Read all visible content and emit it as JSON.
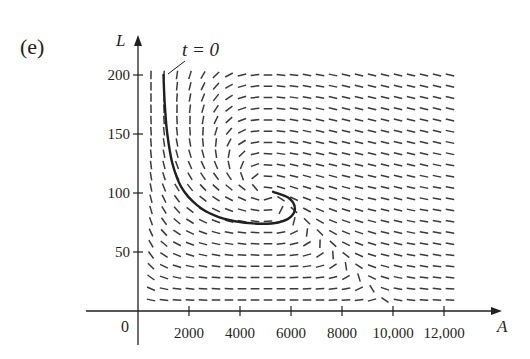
{
  "figure": {
    "panel_label": "(e)",
    "annotation": "t = 0"
  },
  "chart_data": {
    "type": "direction_field",
    "title": "",
    "panel": "(e)",
    "xlabel": "A",
    "ylabel": "L",
    "xlim": [
      0,
      12000
    ],
    "ylim": [
      0,
      200
    ],
    "x_ticks": [
      2000,
      4000,
      6000,
      8000,
      10000,
      12000
    ],
    "x_tick_labels": [
      "2000",
      "4000",
      "6000",
      "8000",
      "10,000",
      "12,000"
    ],
    "y_ticks": [
      50,
      100,
      150,
      200
    ],
    "y_tick_labels": [
      "50",
      "100",
      "150",
      "200"
    ],
    "origin_label": "0",
    "grid": false,
    "field_model": {
      "dA_dt": "2A(1 - A/10000) - 0.01AL",
      "dL_dt": "-0.5L + 0.0001AL",
      "columns": 24,
      "rows": 21
    },
    "trajectory": {
      "label": "t = 0",
      "points": [
        [
          1000,
          200
        ],
        [
          1050,
          175
        ],
        [
          1150,
          150
        ],
        [
          1350,
          125
        ],
        [
          1700,
          105
        ],
        [
          2300,
          90
        ],
        [
          3000,
          81
        ],
        [
          3800,
          76
        ],
        [
          4700,
          74
        ],
        [
          5500,
          75
        ],
        [
          6000,
          80
        ],
        [
          6150,
          88
        ],
        [
          5900,
          96
        ],
        [
          5300,
          101
        ]
      ]
    }
  },
  "axes": {
    "x_label": "A",
    "y_label": "L",
    "origin": "0",
    "x_tick_labels": [
      "2000",
      "4000",
      "6000",
      "8000",
      "10,000",
      "12,000"
    ],
    "y_tick_labels": [
      "50",
      "100",
      "150",
      "200"
    ]
  },
  "colors": {
    "ink": "#231f20",
    "segment": "#3a3a3a",
    "background": "#ffffff"
  }
}
